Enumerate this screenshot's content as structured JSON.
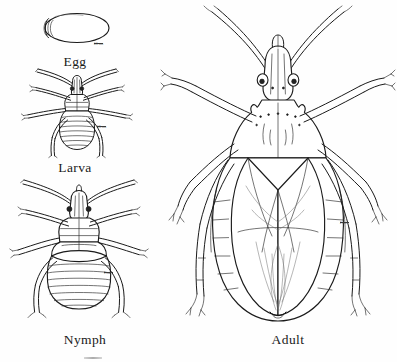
{
  "plate": {
    "title": "Insect life cycle plate",
    "background_color": "#fefefe",
    "ink_color": "#1b1b1b",
    "dimensions": {
      "width": 397,
      "height": 362
    }
  },
  "figures": [
    {
      "id": "egg",
      "label": "Egg",
      "label_x": 75,
      "label_y": 54,
      "scale_bar": {
        "text": "0.1 mm",
        "x": 98,
        "y": 44
      },
      "description": "Oval egg with operculum cap at left end"
    },
    {
      "id": "larva",
      "label": "Larva",
      "label_x": 75,
      "label_y": 160,
      "scale_bar": {
        "text": "0.5 mm",
        "x": 101,
        "y": 127
      },
      "description": "First instar larva, dorsal view, segmented abdomen, six legs, two antennae"
    },
    {
      "id": "nymph",
      "label": "Nymph",
      "label_x": 85,
      "label_y": 334,
      "scale_bar": {
        "text": "1 mm",
        "x": 108,
        "y": 273
      },
      "description": "Late instar nymph, dorsal view, wing pads, segmented abdomen"
    },
    {
      "id": "adult",
      "label": "Adult",
      "label_x": 288,
      "label_y": 334,
      "scale_bar": {
        "text": "2 mm",
        "x": 344,
        "y": 223
      },
      "description": "Adult true bug, dorsal view, hemelytra folded over abdomen, spined pronotum, prominent compound eyes"
    }
  ]
}
